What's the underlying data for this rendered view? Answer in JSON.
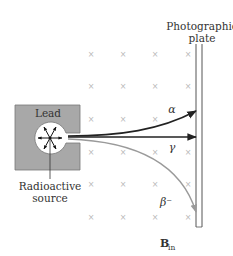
{
  "labels": {
    "plate_line1": "Photographic",
    "plate_line2": "plate",
    "lead": "Lead",
    "source_line1": "Radioactive",
    "source_line2": "source",
    "alpha": "α",
    "gamma": "γ",
    "beta": "β⁻",
    "field_main": "B",
    "field_sub": "in"
  },
  "field_marker": "×",
  "colors": {
    "lead_fill": "#a8a8a8",
    "alpha_ray": "#222222",
    "gamma_ray": "#222222",
    "beta_ray": "#9a9a9a",
    "plate": "#555555",
    "field_marks": "#b8b8b8"
  }
}
